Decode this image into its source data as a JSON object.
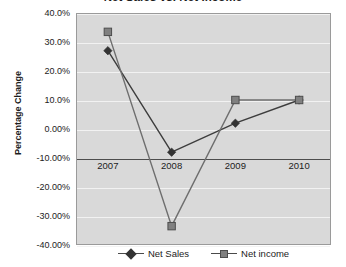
{
  "chart_data": {
    "type": "line",
    "title": "Net Sales vs. Net Income",
    "xlabel": "",
    "ylabel": "Percentage Change",
    "categories": [
      "2007",
      "2008",
      "2009",
      "2010"
    ],
    "series": [
      {
        "name": "Net Sales",
        "marker": "diamond",
        "color": "#333333",
        "values": [
          27.0,
          -8.0,
          2.0,
          10.0
        ]
      },
      {
        "name": "Net income",
        "marker": "square",
        "color": "#808080",
        "values": [
          33.5,
          -33.5,
          10.0,
          10.0
        ]
      }
    ],
    "ylim": [
      -40,
      40
    ],
    "y_ticks": [
      40,
      30,
      20,
      10,
      0,
      -10,
      -20,
      -30,
      -40
    ],
    "y_tick_labels": [
      "40.0%",
      "30.0%",
      "20.0%",
      "10.0%",
      "0.00%",
      "-10.00%",
      "-20.00%",
      "-30.00%",
      "-40.00%"
    ],
    "grid": true,
    "grid_color": "#f2f2f2",
    "plot_background": "#d9d9d9",
    "category_axis_value": -10,
    "legend_position": "bottom"
  },
  "legend": {
    "entries": [
      {
        "label": "Net Sales"
      },
      {
        "label": "Net income"
      }
    ]
  }
}
